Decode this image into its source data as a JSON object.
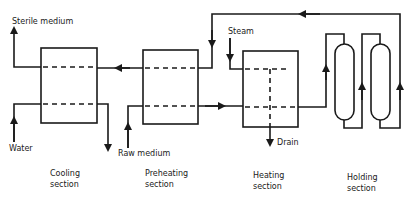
{
  "diagram": {
    "colors": {
      "line": "#1a1a1a",
      "background": "#ffffff"
    },
    "streams": {
      "sterile_medium": "Sterile medium",
      "water": "Water",
      "raw_medium": "Raw medium",
      "steam": "Steam",
      "drain": "Drain"
    },
    "sections": [
      {
        "line1": "Cooling",
        "line2": "section"
      },
      {
        "line1": "Preheating",
        "line2": "section"
      },
      {
        "line1": "Heating",
        "line2": "section"
      },
      {
        "line1": "Holding",
        "line2": "section"
      }
    ]
  }
}
